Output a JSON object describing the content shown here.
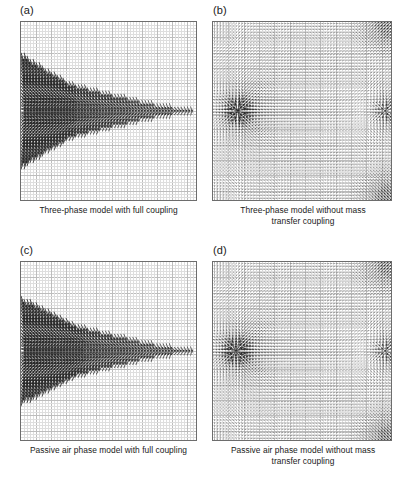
{
  "figure": {
    "layout": "2x2",
    "background": "#ffffff",
    "grid_minor_color": "#dedede",
    "grid_major_color": "#bdbdbd",
    "axis_color": "#6d6d6d",
    "arrow_color": "#262626"
  },
  "panels": [
    {
      "id": "a",
      "label": "(a)",
      "caption": "Three-phase model with full coupling",
      "chart_data": {
        "type": "quiver",
        "title": "Three-phase model with full coupling",
        "xlabel": "",
        "ylabel": "",
        "grid": true,
        "xlim": [
          0,
          1
        ],
        "ylim": [
          0,
          1
        ],
        "nx": 58,
        "ny": 58,
        "minor_cells": 58,
        "major_every": 5,
        "field": "wedge",
        "field_params": {
          "source_x": 0.02,
          "source_y": 0.5,
          "wedge_half_height": 0.3,
          "wedge_tip_x": 0.3,
          "tail_end_x": 1.0,
          "jet_strength": 1.0,
          "converge_strength": 1.0,
          "max_arrow_px": 9.5,
          "background_strength": 0.0
        }
      }
    },
    {
      "id": "b",
      "label": "(b)",
      "caption": "Three-phase model without mass\ntransfer coupling",
      "chart_data": {
        "type": "quiver",
        "title": "Three-phase model without mass transfer coupling",
        "xlabel": "",
        "ylabel": "",
        "grid": true,
        "xlim": [
          0,
          1
        ],
        "ylim": [
          0,
          1
        ],
        "nx": 58,
        "ny": 58,
        "minor_cells": 58,
        "major_every": 5,
        "field": "radial_source",
        "field_params": {
          "source_x": 0.14,
          "source_y": 0.5,
          "sink_x": 0.97,
          "sink_y": 0.5,
          "source_strength": 1.0,
          "sink_strength": 0.55,
          "corner_outflow": true,
          "corner_strength": 0.85,
          "max_arrow_px": 9.0,
          "background_strength": 0.16
        }
      }
    },
    {
      "id": "c",
      "label": "(c)",
      "caption": "Passive air phase model with full coupling",
      "chart_data": {
        "type": "quiver",
        "title": "Passive air phase model with full coupling",
        "xlabel": "",
        "ylabel": "",
        "grid": true,
        "xlim": [
          0,
          1
        ],
        "ylim": [
          0,
          1
        ],
        "nx": 58,
        "ny": 58,
        "minor_cells": 58,
        "major_every": 5,
        "field": "wedge",
        "field_params": {
          "source_x": 0.02,
          "source_y": 0.5,
          "wedge_half_height": 0.28,
          "wedge_tip_x": 0.34,
          "tail_end_x": 1.0,
          "jet_strength": 1.0,
          "converge_strength": 0.92,
          "max_arrow_px": 9.5,
          "background_strength": 0.0
        }
      }
    },
    {
      "id": "d",
      "label": "(d)",
      "caption": "Passive air phase model without mass\ntransfer coupling",
      "chart_data": {
        "type": "quiver",
        "title": "Passive air phase model without mass transfer coupling",
        "xlabel": "",
        "ylabel": "",
        "grid": true,
        "xlim": [
          0,
          1
        ],
        "ylim": [
          0,
          1
        ],
        "nx": 58,
        "ny": 58,
        "minor_cells": 58,
        "major_every": 5,
        "field": "radial_source",
        "field_params": {
          "source_x": 0.13,
          "source_y": 0.5,
          "sink_x": 0.97,
          "sink_y": 0.5,
          "source_strength": 1.0,
          "sink_strength": 0.5,
          "corner_outflow": true,
          "corner_strength": 0.8,
          "max_arrow_px": 9.0,
          "background_strength": 0.15
        }
      }
    }
  ]
}
